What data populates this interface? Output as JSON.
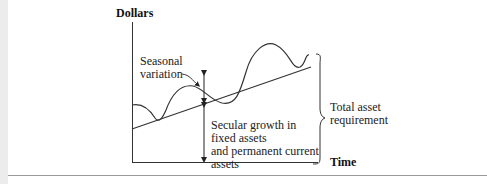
{
  "diagram": {
    "y_axis_label": "Dollars",
    "x_axis_label": "Time",
    "annotations": {
      "seasonal": [
        "Seasonal",
        "variation"
      ],
      "secular": [
        "Secular growth in",
        "fixed assets",
        "and permanent current",
        "assets"
      ],
      "total": [
        "Total asset",
        "requirement"
      ]
    },
    "colors": {
      "line": "#333333",
      "text": "#222222",
      "strip": "#ececec",
      "rule": "#9a9a9a"
    }
  }
}
